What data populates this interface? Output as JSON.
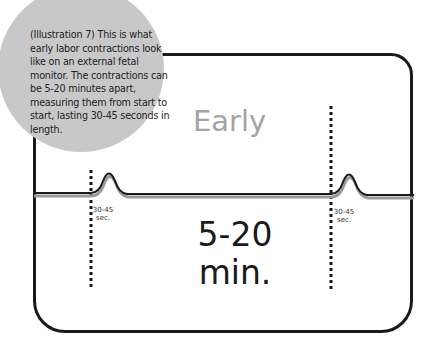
{
  "caption": "(Illustration 7) This is what early labor contractions look like on an external fetal monitor. The contractions can be 5-20 minutes apart, measuring them from start to start, lasting 30-45 seconds in length.",
  "phase_label": "Early",
  "interval": {
    "value": "5-20",
    "unit": "min."
  },
  "contractions": [
    {
      "duration_label": "30-45",
      "duration_unit": "sec."
    },
    {
      "duration_label": "30-45",
      "duration_unit": "sec."
    }
  ],
  "colors": {
    "bubble": "#c8c8c8",
    "phase_text": "#a4a4a4",
    "frame": "#1a1a1a"
  }
}
